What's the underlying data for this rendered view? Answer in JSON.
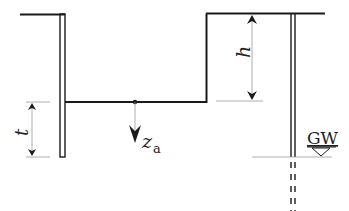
{
  "diagram": {
    "type": "excavation-cross-section",
    "labels": {
      "h": "h",
      "t": "t",
      "z": "z",
      "z_sub": "a",
      "gw": "GW"
    },
    "colors": {
      "line": "#1a1a1a",
      "dim_line": "#9a9a9a",
      "background": "#ffffff"
    }
  }
}
